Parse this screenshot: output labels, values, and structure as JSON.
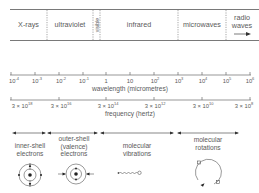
{
  "spectrum_band": {
    "regions": [
      {
        "label": "X-rays"
      },
      {
        "label": "ultraviolet"
      },
      {
        "label": "visible"
      },
      {
        "label": "infrared"
      },
      {
        "label": "microwaves"
      },
      {
        "label_line1": "radio",
        "label_line2": "waves"
      }
    ]
  },
  "wavelength_axis": {
    "title": "wavelength (micrometres)",
    "ticks": [
      {
        "base": "10",
        "exp": "-4"
      },
      {
        "base": "10",
        "exp": "-3"
      },
      {
        "base": "10",
        "exp": "-2"
      },
      {
        "base": "10",
        "exp": "-1"
      },
      {
        "base": "1",
        "exp": ""
      },
      {
        "base": "10",
        "exp": ""
      },
      {
        "base": "10",
        "exp": "2"
      },
      {
        "base": "10",
        "exp": "3"
      },
      {
        "base": "10",
        "exp": "4"
      },
      {
        "base": "10",
        "exp": "5"
      },
      {
        "base": "10",
        "exp": "6"
      }
    ]
  },
  "frequency_axis": {
    "title": "frequency (hertz)",
    "ticks": [
      {
        "base": "3 × 10",
        "exp": "18"
      },
      {
        "base": "3 × 10",
        "exp": "16"
      },
      {
        "base": "3 × 10",
        "exp": "14"
      },
      {
        "base": "3 × 10",
        "exp": "12"
      },
      {
        "base": "3 × 10",
        "exp": "10"
      },
      {
        "base": "3 × 10",
        "exp": "8"
      }
    ]
  },
  "interactions": [
    {
      "line1": "inner-shell",
      "line2": "electrons",
      "line3": "",
      "icon": "atom-inner-shell-icon"
    },
    {
      "line1": "outer-shell",
      "line2": "(valence)",
      "line3": "electrons",
      "icon": "atom-outer-shell-icon"
    },
    {
      "line1": "molecular",
      "line2": "vibrations",
      "line3": "",
      "icon": "spring-vibration-icon"
    },
    {
      "line1": "molecular",
      "line2": "rotations",
      "line3": "",
      "icon": "rotation-icon"
    }
  ],
  "colors": {
    "line": "#6a6a6a",
    "text": "#5a5a5a",
    "background": "#ffffff"
  }
}
